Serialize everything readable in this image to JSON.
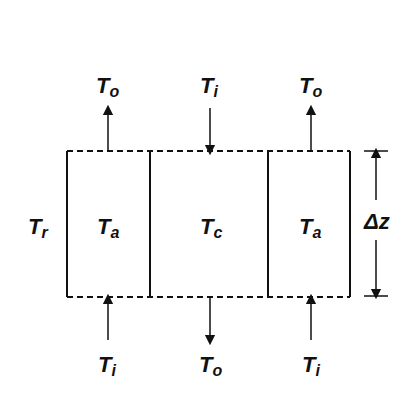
{
  "diagram": {
    "top_labels": [
      {
        "main": "T",
        "sub": "o",
        "direction": "up"
      },
      {
        "main": "T",
        "sub": "i",
        "direction": "down"
      },
      {
        "main": "T",
        "sub": "o",
        "direction": "up"
      }
    ],
    "bottom_labels": [
      {
        "main": "T",
        "sub": "i",
        "direction": "up"
      },
      {
        "main": "T",
        "sub": "o",
        "direction": "down"
      },
      {
        "main": "T",
        "sub": "i",
        "direction": "up"
      }
    ],
    "compartments": [
      {
        "main": "T",
        "sub": "a"
      },
      {
        "main": "T",
        "sub": "c"
      },
      {
        "main": "T",
        "sub": "a"
      }
    ],
    "side_label": {
      "main": "T",
      "sub": "r"
    },
    "dimension": {
      "label": "Δz"
    },
    "colors": {
      "line": "#111111",
      "background": "#ffffff"
    }
  }
}
